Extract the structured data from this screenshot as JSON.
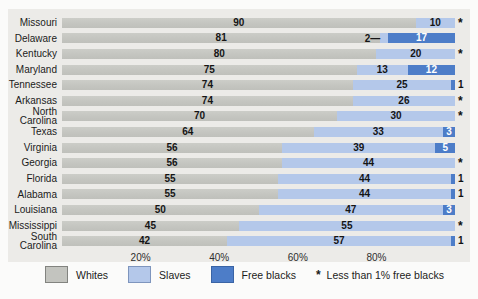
{
  "chart_data": {
    "type": "bar",
    "variant": "horizontal-stacked-100pct",
    "unit": "percent",
    "title": "",
    "xlabel": "",
    "ylabel": "",
    "xlim": [
      0,
      100
    ],
    "grid": false,
    "axis": {
      "ticks": [
        "20%",
        "40%",
        "60%",
        "80%"
      ],
      "tick_positions": [
        20,
        40,
        60,
        80
      ]
    },
    "series_names": [
      "Whites",
      "Slaves",
      "Free blacks"
    ],
    "rows": [
      {
        "state": "Missouri",
        "whites": 90,
        "slaves": 10,
        "free": 0,
        "whites_label": "90",
        "slaves_label": "10",
        "slaves_label_leader": false,
        "free_label": "*",
        "free_label_style": "asterisk"
      },
      {
        "state": "Delaware",
        "whites": 81,
        "slaves": 2,
        "free": 17,
        "whites_label": "81",
        "slaves_label": "2—",
        "slaves_label_leader": true,
        "free_label": "17",
        "free_label_style": "inside"
      },
      {
        "state": "Kentucky",
        "whites": 80,
        "slaves": 20,
        "free": 0,
        "whites_label": "80",
        "slaves_label": "20",
        "slaves_label_leader": false,
        "free_label": "*",
        "free_label_style": "asterisk"
      },
      {
        "state": "Maryland",
        "whites": 75,
        "slaves": 13,
        "free": 12,
        "whites_label": "75",
        "slaves_label": "13",
        "slaves_label_leader": false,
        "free_label": "12",
        "free_label_style": "inside"
      },
      {
        "state": "Tennessee",
        "whites": 74,
        "slaves": 25,
        "free": 1,
        "whites_label": "74",
        "slaves_label": "25",
        "slaves_label_leader": false,
        "free_label": "1",
        "free_label_style": "outside"
      },
      {
        "state": "Arkansas",
        "whites": 74,
        "slaves": 26,
        "free": 0,
        "whites_label": "74",
        "slaves_label": "26",
        "slaves_label_leader": false,
        "free_label": "*",
        "free_label_style": "asterisk"
      },
      {
        "state": "North Carolina",
        "whites": 70,
        "slaves": 30,
        "free": 0,
        "whites_label": "70",
        "slaves_label": "30",
        "slaves_label_leader": false,
        "free_label": "*",
        "free_label_style": "asterisk"
      },
      {
        "state": "Texas",
        "whites": 64,
        "slaves": 33,
        "free": 3,
        "whites_label": "64",
        "slaves_label": "33",
        "slaves_label_leader": false,
        "free_label": "3",
        "free_label_style": "inside"
      },
      {
        "state": "Virginia",
        "whites": 56,
        "slaves": 39,
        "free": 5,
        "whites_label": "56",
        "slaves_label": "39",
        "slaves_label_leader": false,
        "free_label": "5",
        "free_label_style": "inside"
      },
      {
        "state": "Georgia",
        "whites": 56,
        "slaves": 44,
        "free": 0,
        "whites_label": "56",
        "slaves_label": "44",
        "slaves_label_leader": false,
        "free_label": "*",
        "free_label_style": "asterisk"
      },
      {
        "state": "Florida",
        "whites": 55,
        "slaves": 44,
        "free": 1,
        "whites_label": "55",
        "slaves_label": "44",
        "slaves_label_leader": false,
        "free_label": "1",
        "free_label_style": "outside"
      },
      {
        "state": "Alabama",
        "whites": 55,
        "slaves": 44,
        "free": 1,
        "whites_label": "55",
        "slaves_label": "44",
        "slaves_label_leader": false,
        "free_label": "1",
        "free_label_style": "outside"
      },
      {
        "state": "Louisiana",
        "whites": 50,
        "slaves": 47,
        "free": 3,
        "whites_label": "50",
        "slaves_label": "47",
        "slaves_label_leader": false,
        "free_label": "3",
        "free_label_style": "inside"
      },
      {
        "state": "Mississippi",
        "whites": 45,
        "slaves": 55,
        "free": 0,
        "whites_label": "45",
        "slaves_label": "55",
        "slaves_label_leader": false,
        "free_label": "*",
        "free_label_style": "asterisk"
      },
      {
        "state": "South Carolina",
        "whites": 42,
        "slaves": 57,
        "free": 1,
        "whites_label": "42",
        "slaves_label": "57",
        "slaves_label_leader": false,
        "free_label": "1",
        "free_label_style": "outside"
      }
    ],
    "legend": {
      "position": "bottom",
      "items": [
        {
          "label": "Whites",
          "color": "#c3c4bf"
        },
        {
          "label": "Slaves",
          "color": "#b4c8ea"
        },
        {
          "label": "Free blacks",
          "color": "#4d7dc8"
        }
      ],
      "note_star": "*",
      "note_text": "Less than 1% free blacks"
    },
    "colors": {
      "panel_background": "#ecebe8",
      "whites_bar": "#c7c8c3",
      "slaves_bar": "#b4c8ea",
      "free_blacks_bar": "#4d7dc8",
      "inside_free_value_text": "#ffffff",
      "value_text": "#151515"
    }
  }
}
